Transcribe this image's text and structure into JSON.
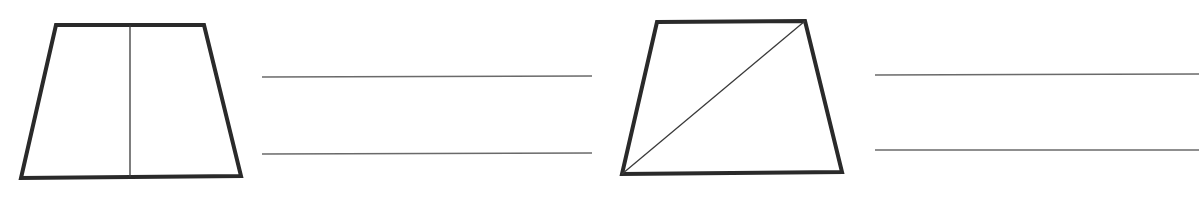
{
  "canvas": {
    "width": 1201,
    "height": 201,
    "background": "#ffffff"
  },
  "colors": {
    "shape_stroke": "#2a2a2a",
    "divider_stroke": "#3a3a3a",
    "answer_line": "#6a6a6a"
  },
  "figures": [
    {
      "id": "trapezoid-vertical-split",
      "points": "56,25 204,25 241,176 21,178",
      "divider": {
        "x1": 130,
        "y1": 25,
        "x2": 130,
        "y2": 177
      },
      "answer_lines": [
        {
          "x1": 262,
          "y1": 77,
          "x2": 592,
          "y2": 76
        },
        {
          "x1": 262,
          "y1": 154,
          "x2": 592,
          "y2": 153
        }
      ]
    },
    {
      "id": "trapezoid-diagonal-split",
      "points": "657,22 805,21 842,172 622,174",
      "divider": {
        "x1": 622,
        "y1": 174,
        "x2": 805,
        "y2": 21
      },
      "answer_lines": [
        {
          "x1": 875,
          "y1": 75,
          "x2": 1199,
          "y2": 74
        },
        {
          "x1": 875,
          "y1": 150,
          "x2": 1199,
          "y2": 150
        }
      ]
    }
  ]
}
